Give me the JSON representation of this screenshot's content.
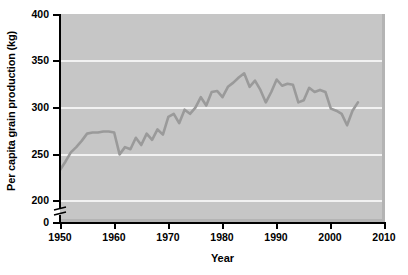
{
  "chart_data": {
    "type": "line",
    "title": "",
    "xlabel": "Year",
    "ylabel": "Per capita grain production (kg)",
    "xlim": [
      1950,
      2010
    ],
    "ylim": [
      200,
      400
    ],
    "y_axis_break": true,
    "y_break_note": "axis broken between 0 and 200",
    "grid": true,
    "grid_color": "#f2f2f2",
    "plot_background": "#c6c6c6",
    "line_color": "#9a9a9a",
    "legend": "none",
    "xticks": [
      1950,
      1960,
      1970,
      1980,
      1990,
      2000,
      2010
    ],
    "xticklabels": [
      "1950",
      "1960",
      "1970",
      "1980",
      "1990",
      "2000",
      "2010"
    ],
    "yticks": [
      0,
      200,
      250,
      300,
      350,
      400
    ],
    "yticklabels": [
      "0",
      "200",
      "250",
      "300",
      "350",
      "400"
    ],
    "series": [
      {
        "name": "Per capita grain production",
        "x": [
          1950,
          1951,
          1952,
          1953,
          1954,
          1955,
          1956,
          1957,
          1958,
          1959,
          1960,
          1961,
          1962,
          1963,
          1964,
          1965,
          1966,
          1967,
          1968,
          1969,
          1970,
          1971,
          1972,
          1973,
          1974,
          1975,
          1976,
          1977,
          1978,
          1979,
          1980,
          1981,
          1982,
          1983,
          1984,
          1985,
          1986,
          1987,
          1988,
          1989,
          1990,
          1991,
          1992,
          1993,
          1994,
          1995,
          1996,
          1997,
          1998,
          1999,
          2000,
          2001,
          2002,
          2003,
          2004,
          2005
        ],
        "values": [
          250,
          258,
          267,
          272,
          278,
          285,
          286,
          286,
          287,
          287,
          286,
          265,
          272,
          270,
          281,
          274,
          285,
          279,
          289,
          284,
          301,
          304,
          295,
          308,
          304,
          310,
          320,
          312,
          325,
          326,
          320,
          330,
          334,
          339,
          343,
          330,
          336,
          327,
          315,
          325,
          337,
          331,
          333,
          332,
          315,
          317,
          329,
          325,
          327,
          325,
          309,
          307,
          304,
          293,
          307,
          315
        ]
      }
    ]
  },
  "axis": {
    "yticklabels": [
      "400",
      "350",
      "300",
      "250",
      "200",
      "0"
    ],
    "xticklabels": [
      "1950",
      "1960",
      "1970",
      "1980",
      "1990",
      "2000",
      "2010"
    ],
    "xlabel": "Year",
    "ylabel": "Per capita grain production (kg)"
  }
}
